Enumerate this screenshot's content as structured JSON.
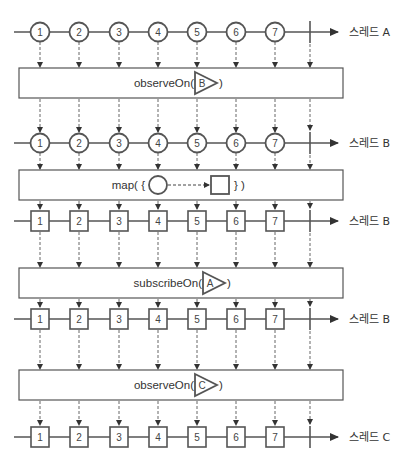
{
  "diagram": {
    "type": "marble-diagram",
    "colors": {
      "line": "#555555",
      "marble_stroke": "#555555",
      "dashed_arrow": "#666666",
      "text": "#333333",
      "background": "#ffffff"
    },
    "x_positions": [
      40,
      79,
      119,
      158,
      197,
      236,
      275
    ],
    "completion_x": 310,
    "timelines": [
      {
        "id": "t1",
        "y": 32,
        "shape": "circle",
        "values": [
          "1",
          "2",
          "3",
          "4",
          "5",
          "6",
          "7"
        ],
        "label": "스레드 A"
      },
      {
        "id": "t2",
        "y": 143,
        "shape": "circle",
        "values": [
          "1",
          "2",
          "3",
          "4",
          "5",
          "6",
          "7"
        ],
        "label": "스레드 B"
      },
      {
        "id": "t3",
        "y": 221,
        "shape": "square",
        "values": [
          "1",
          "2",
          "3",
          "4",
          "5",
          "6",
          "7"
        ],
        "label": "스레드 B"
      },
      {
        "id": "t4",
        "y": 319,
        "shape": "square",
        "values": [
          "1",
          "2",
          "3",
          "4",
          "5",
          "6",
          "7"
        ],
        "label": "스레드 B"
      },
      {
        "id": "t5",
        "y": 437,
        "shape": "square",
        "values": [
          "1",
          "2",
          "3",
          "4",
          "5",
          "6",
          "7"
        ],
        "label": "스레드 C"
      }
    ],
    "operators": [
      {
        "id": "op1",
        "y": 68,
        "height": 30,
        "prefix": "observeOn(",
        "scheduler": "B",
        "suffix": ")"
      },
      {
        "id": "op2",
        "y": 170,
        "height": 30,
        "prefix": "map( {",
        "transform": "circle-to-square",
        "suffix": "} )"
      },
      {
        "id": "op3",
        "y": 268,
        "height": 30,
        "prefix": "subscribeOn(",
        "scheduler": "A",
        "suffix": ")"
      },
      {
        "id": "op4",
        "y": 370,
        "height": 30,
        "prefix": "observeOn(",
        "scheduler": "C",
        "suffix": ")"
      }
    ]
  }
}
